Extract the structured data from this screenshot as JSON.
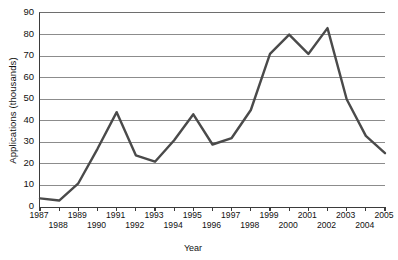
{
  "chart_data": {
    "type": "line",
    "title": "",
    "xlabel": "Year",
    "ylabel": "Applications (thousands)",
    "categories": [
      "1987",
      "1988",
      "1989",
      "1990",
      "1991",
      "1992",
      "1993",
      "1994",
      "1995",
      "1996",
      "1997",
      "1998",
      "1999",
      "2000",
      "2001",
      "2002",
      "2003",
      "2004",
      "2005"
    ],
    "x": [
      1987,
      1988,
      1989,
      1990,
      1991,
      1992,
      1993,
      1994,
      1995,
      1996,
      1997,
      1998,
      1999,
      2000,
      2001,
      2002,
      2003,
      2004,
      2005
    ],
    "values": [
      4,
      3,
      11,
      27,
      44,
      24,
      21,
      31,
      43,
      29,
      32,
      45,
      71,
      80,
      71,
      83,
      50,
      33,
      25
    ],
    "series": [
      {
        "name": "Applications",
        "values": [
          4,
          3,
          11,
          27,
          44,
          24,
          21,
          31,
          43,
          29,
          32,
          45,
          71,
          80,
          71,
          83,
          50,
          33,
          25
        ]
      }
    ],
    "ylim": [
      0,
      90
    ],
    "yticks": [
      0,
      10,
      20,
      30,
      40,
      50,
      60,
      70,
      80,
      90
    ],
    "ytick_labels": [
      "0",
      "10",
      "20",
      "30",
      "40",
      "50",
      "60",
      "70",
      "80",
      "90"
    ],
    "xlim": [
      1987,
      2005
    ],
    "grid": "horizontal",
    "legend": "none",
    "line_color": "#4a4a4a",
    "gridline_color": "#8c8c8c",
    "axis_color": "#3b3b3b",
    "background": "#ffffff"
  },
  "axes": {
    "y_title": "Applications (thousands)",
    "x_title": "Year"
  }
}
